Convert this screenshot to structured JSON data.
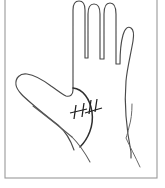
{
  "figure": {
    "caption": "",
    "border_color": "#9a9a9a",
    "outline_color": "#4a4a4a",
    "crease_color": "#5a5a5a",
    "accent_color": "#1f1f1f",
    "background_color": "#ffffff",
    "view": "palmar",
    "side": "right",
    "annotation_label": "",
    "marks": {
      "name": "suture-hatch-marks",
      "count": 6,
      "region": "thenar-eminence"
    },
    "parts": [
      {
        "name": "thumb",
        "label": ""
      },
      {
        "name": "index-finger",
        "label": ""
      },
      {
        "name": "middle-finger",
        "label": ""
      },
      {
        "name": "ring-finger",
        "label": ""
      },
      {
        "name": "little-finger",
        "label": ""
      },
      {
        "name": "palm",
        "label": ""
      },
      {
        "name": "wrist",
        "label": ""
      }
    ],
    "geometry": {
      "frame": {
        "x": 4.5,
        "y": -2,
        "width": 153,
        "height": 180
      },
      "hand_path": "M 73 148 C 70 138, 65 129, 57 122 C 48 115, 38 108, 30 101 C 23 95, 17 90, 16 84 C 15 78, 19 74, 25 74 C 32 74, 42 79, 50 85 C 56 89, 61 93, 65 95 C 69 97, 72 96, 73 92 C 74 84, 74 70, 74 58 C 74 40, 74 20, 74 10 C 74 4, 76 0, 80 0 C 84 0, 86 4, 86 10 L 86 57 L 89 57 C 89 45, 89 26, 89 14 C 89 7, 91 3, 95 3 C 99 3, 101 7, 101 14 L 101 58 L 105 58 C 105 46, 105 25, 105 13 C 105 6, 107 2, 111 2 C 115 2, 117 6, 117 13 L 117 63 L 121 63 C 121 54, 122 40, 124 33 C 126 27, 129 25, 132 27 C 135 29, 135 34, 134 40 C 132 52, 128 68, 126 80 C 124 92, 124 105, 125 118 C 126 132, 128 142, 130 151 L 130 156",
      "thumb_web_path": "M 67 80 C 63 82, 60 86, 58 90",
      "thenar_arc_path": "M 74 83 C 84 86, 91 96, 92 110 C 93 124, 88 136, 80 144",
      "palm_crease_paths": [
        "M 34 104 C 46 114, 60 124, 72 134",
        "M 72 134 C 78 139, 84 147, 90 158"
      ],
      "suture_marks": [
        {
          "x1": 72,
          "y1": 112,
          "x2": 87,
          "y2": 108
        },
        {
          "x1": 85,
          "y1": 112,
          "x2": 100,
          "y2": 108
        },
        {
          "x1": 76,
          "y1": 105,
          "x2": 74,
          "y2": 118
        },
        {
          "x1": 83,
          "y1": 103,
          "x2": 81,
          "y2": 116
        },
        {
          "x1": 90,
          "y1": 101,
          "x2": 88,
          "y2": 114
        },
        {
          "x1": 96,
          "y1": 100,
          "x2": 94,
          "y2": 113
        }
      ],
      "ulnar_border_path": "M 131 103 C 131 112, 130 120, 128 126 C 127 131, 126 134, 125 137 C 129 146, 134 155, 139 165"
    }
  }
}
